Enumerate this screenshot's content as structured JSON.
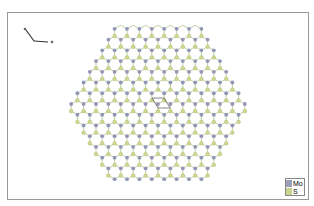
{
  "viewer": {
    "axes": {
      "a_label": "a",
      "b_label": "b",
      "c_label": "c"
    },
    "lattice": {
      "center": [
        157,
        103
      ],
      "spacing": 12.4,
      "radius_cells": 8,
      "unit_cell": "parallelogram"
    },
    "legend": [
      {
        "label": "Mo",
        "color": "#9aa0b8"
      },
      {
        "label": "S",
        "color": "#c8d48a"
      }
    ],
    "colors": {
      "mo": "#8f97b4",
      "s": "#cdd98f",
      "bond": "#b8c090",
      "frame": "#9a9a9a"
    }
  }
}
